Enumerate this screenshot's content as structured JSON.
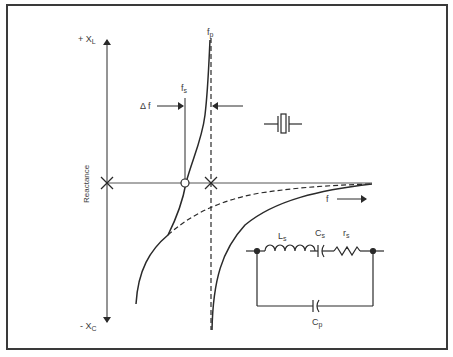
{
  "figure": {
    "axes": {
      "y_top_label": "+ X",
      "y_top_sub": "L",
      "y_bottom_label": "- X",
      "y_bottom_sub": "C",
      "y_axis_title": "Reactance",
      "x_arrow_label": "f"
    },
    "markers": {
      "fs_label": "f",
      "fs_sub": "s",
      "fp_label": "f",
      "fp_sub": "p",
      "delta_f_label": "Δ f"
    },
    "crystal_symbol": "crystal-icon",
    "circuit": {
      "inductor_label": "L",
      "inductor_sub": "s",
      "series_cap_label": "C",
      "series_cap_sub": "s",
      "resistor_label": "r",
      "resistor_sub": "s",
      "parallel_cap_label": "C",
      "parallel_cap_sub": "p"
    },
    "colors": {
      "line": "#2a2a2a",
      "frame": "#3a3a3a",
      "background": "#ffffff"
    }
  }
}
